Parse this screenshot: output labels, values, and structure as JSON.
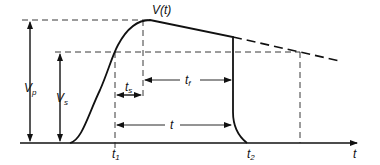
{
  "diagram": {
    "labels": {
      "curve": "V(t)",
      "peak_voltage": "V",
      "peak_voltage_sub": "p",
      "sustain_voltage": "V",
      "sustain_voltage_sub": "s",
      "rise_to_peak": "t",
      "rise_to_peak_sub": "s",
      "fall_interval": "t",
      "fall_interval_sub": "f",
      "total_interval": "t",
      "time_start": "t",
      "time_start_sub": "1",
      "time_end": "t",
      "time_end_sub": "2",
      "time_axis": "t"
    },
    "colors": {
      "line": "#111111",
      "background": "#ffffff"
    }
  }
}
